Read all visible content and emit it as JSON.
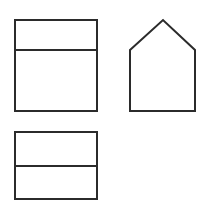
{
  "canvas": {
    "width": 208,
    "height": 214,
    "background": "#ffffff"
  },
  "style": {
    "stroke": "#2b2b2b",
    "stroke_width": 2,
    "fill": "#ffffff"
  },
  "shapes": [
    {
      "id": "top-left-rect",
      "type": "rect-split",
      "x": 15,
      "y": 20,
      "width": 82,
      "height": 91,
      "divider_y": 50
    },
    {
      "id": "house-pentagon",
      "type": "polygon",
      "points": "130,50 163,20 195,50 195,111 130,111"
    },
    {
      "id": "bottom-left-rect",
      "type": "rect-split",
      "x": 15,
      "y": 132,
      "width": 82,
      "height": 67,
      "divider_y": 166
    }
  ]
}
